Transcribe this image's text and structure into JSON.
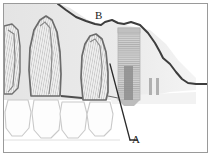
{
  "figure": {
    "type": "anatomical-line-diagram",
    "border_color": "#9a9a9a",
    "background_color": "#ffffff"
  },
  "labels": [
    {
      "id": "A",
      "text": "A",
      "target": "implant-crestal-bone-defect",
      "x": 132,
      "y": 134
    },
    {
      "id": "B",
      "text": "B",
      "target": "alveolar-bone-crest-contour",
      "x": 95,
      "y": 10
    }
  ],
  "leader_lines": [
    {
      "id": "leader-a",
      "from_x": 112,
      "from_y": 68,
      "to_x": 130,
      "to_y": 140
    },
    {
      "id": "leader-b",
      "from_x": 101,
      "from_y": 22,
      "to_x": 101,
      "to_y": 22
    }
  ],
  "anatomy": {
    "bone_shade_color": "#e7e7e7",
    "bone_outline_color": "#4a4a4a",
    "tooth_outline_color": "#6e6e6e",
    "root_hatch_color": "#8d8d8d",
    "implant_body_color": "#c9c9c9",
    "implant_thread_color": "#a6a6a6",
    "implant_channel_color": "#8a8a8a"
  },
  "structures": [
    {
      "name": "alveolar-bone",
      "description": "Shaded bone mass occupying upper two thirds of field"
    },
    {
      "name": "bone-crest-line",
      "description": "Dark contour descending from left to right, labelled B"
    },
    {
      "name": "tooth-root-1",
      "description": "Partial root at far left edge"
    },
    {
      "name": "tooth-root-2",
      "description": "Full conical root, second from left"
    },
    {
      "name": "tooth-root-3",
      "description": "Full conical root adjacent to implant"
    },
    {
      "name": "tooth-crown-row",
      "description": "Four crown outlines along lower border"
    },
    {
      "name": "dental-implant",
      "description": "Threaded cylindrical endosseous implant with internal channel"
    },
    {
      "name": "implant-thread-marks",
      "description": "Two short vertical radiopaque marks right of implant"
    }
  ]
}
